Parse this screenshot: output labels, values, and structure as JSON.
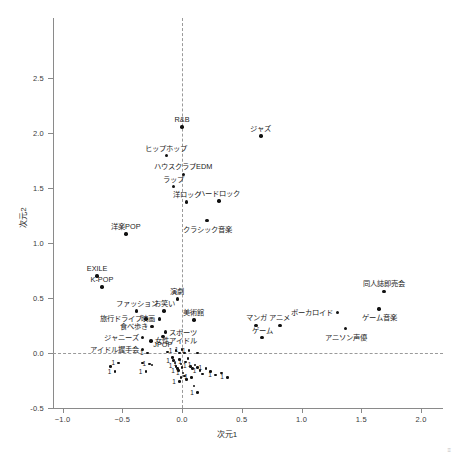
{
  "chart_data": {
    "type": "scatter",
    "title": "",
    "xlabel": "次元1",
    "ylabel": "次元2",
    "xlim": [
      -1.25,
      2.2
    ],
    "ylim": [
      -0.55,
      2.8
    ],
    "xticks": [
      -1.0,
      -0.5,
      0.0,
      0.5,
      1.0,
      1.5,
      2.0
    ],
    "xticklabels": [
      "−1.0",
      "−0.5",
      "0.0",
      "0.5",
      "1.0",
      "1.5",
      "2.0"
    ],
    "yticks": [
      -0.5,
      0.0,
      0.5,
      1.0,
      1.5,
      2.0,
      2.5
    ],
    "yticklabels": [
      "-0.5",
      "0.0",
      "0.5",
      "1.0",
      "1.5",
      "2.0",
      "2.5"
    ],
    "grid": false,
    "reference_lines": {
      "vertical_x": 0.0,
      "horizontal_y": 0.0,
      "style": "dashed"
    },
    "legend": null,
    "marker_color": "#111111",
    "labeled_points": [
      {
        "label": "R&B",
        "x": 0.0,
        "y": 2.05,
        "lpos": "above"
      },
      {
        "label": "ジャズ",
        "x": 0.66,
        "y": 1.97,
        "lpos": "above"
      },
      {
        "label": "ヒップホップ",
        "x": -0.13,
        "y": 1.79,
        "lpos": "above"
      },
      {
        "label": "ハウスクラブEDM",
        "x": 0.01,
        "y": 1.62,
        "lpos": "above"
      },
      {
        "label": "ラップ",
        "x": -0.07,
        "y": 1.51,
        "lpos": "above"
      },
      {
        "label": "洋ロック",
        "x": 0.04,
        "y": 1.37,
        "lpos": "above"
      },
      {
        "label": "ハードロック",
        "x": 0.31,
        "y": 1.38,
        "lpos": "above"
      },
      {
        "label": "洋楽POP",
        "x": -0.47,
        "y": 1.08,
        "lpos": "above"
      },
      {
        "label": "クラシック音楽",
        "x": 0.21,
        "y": 1.2,
        "lpos": "below"
      },
      {
        "label": "EXILE",
        "x": -0.71,
        "y": 0.7,
        "lpos": "above"
      },
      {
        "label": "K-POP",
        "x": -0.67,
        "y": 0.6,
        "lpos": "above"
      },
      {
        "label": "同人誌即売会",
        "x": 1.69,
        "y": 0.56,
        "lpos": "above"
      },
      {
        "label": "演劇",
        "x": -0.04,
        "y": 0.49,
        "lpos": "above"
      },
      {
        "label": "ファッション",
        "x": -0.38,
        "y": 0.38,
        "lpos": "above"
      },
      {
        "label": "お笑い",
        "x": -0.15,
        "y": 0.38,
        "lpos": "above"
      },
      {
        "label": "ボーカロイド",
        "x": 1.3,
        "y": 0.37,
        "lpos": "left"
      },
      {
        "label": "ゲーム音楽",
        "x": 1.65,
        "y": 0.4,
        "lpos": "below"
      },
      {
        "label": "旅行ドライブ",
        "x": -0.3,
        "y": 0.31,
        "lpos": "left"
      },
      {
        "label": "映画",
        "x": -0.19,
        "y": 0.31,
        "lpos": "left"
      },
      {
        "label": "美術館",
        "x": 0.1,
        "y": 0.3,
        "lpos": "above"
      },
      {
        "label": "マンガ",
        "x": 0.62,
        "y": 0.25,
        "lpos": "above"
      },
      {
        "label": "アニメ",
        "x": 0.82,
        "y": 0.25,
        "lpos": "above"
      },
      {
        "label": "食べ歩き",
        "x": -0.25,
        "y": 0.24,
        "lpos": "left"
      },
      {
        "label": "スポーツ",
        "x": -0.14,
        "y": 0.19,
        "lpos": "right"
      },
      {
        "label": "アニソン声優",
        "x": 1.37,
        "y": 0.22,
        "lpos": "below"
      },
      {
        "label": "JPOP",
        "x": -0.16,
        "y": 0.15,
        "lpos": "below"
      },
      {
        "label": "ゲーム",
        "x": 0.67,
        "y": 0.14,
        "lpos": "above"
      },
      {
        "label": "ジャニーズ",
        "x": -0.33,
        "y": 0.14,
        "lpos": "left"
      },
      {
        "label": "女性アイドル",
        "x": -0.26,
        "y": 0.11,
        "lpos": "right"
      },
      {
        "label": "アイドル握手会",
        "x": -0.33,
        "y": 0.03,
        "lpos": "left"
      }
    ],
    "unlabeled_points_note": "dense central cluster of unlabeled points, each annotated with the count label \"1\"",
    "count_label": "1",
    "cluster_points": [
      {
        "x": -0.29,
        "y": 0.0
      },
      {
        "x": -0.12,
        "y": 0.01
      },
      {
        "x": -0.05,
        "y": 0.02
      },
      {
        "x": -0.02,
        "y": 0.0
      },
      {
        "x": 0.0,
        "y": 0.03
      },
      {
        "x": 0.02,
        "y": 0.0
      },
      {
        "x": 0.06,
        "y": 0.02
      },
      {
        "x": 0.13,
        "y": 0.0
      },
      {
        "x": -0.53,
        "y": -0.09
      },
      {
        "x": -0.6,
        "y": -0.12
      },
      {
        "x": -0.56,
        "y": -0.17
      },
      {
        "x": -0.33,
        "y": -0.09
      },
      {
        "x": -0.27,
        "y": -0.1
      },
      {
        "x": -0.25,
        "y": -0.11
      },
      {
        "x": -0.3,
        "y": -0.17
      },
      {
        "x": -0.08,
        "y": -0.04
      },
      {
        "x": -0.07,
        "y": -0.07
      },
      {
        "x": -0.06,
        "y": -0.09
      },
      {
        "x": -0.05,
        "y": -0.12
      },
      {
        "x": -0.04,
        "y": -0.14
      },
      {
        "x": -0.03,
        "y": -0.16
      },
      {
        "x": -0.02,
        "y": -0.06
      },
      {
        "x": -0.01,
        "y": -0.1
      },
      {
        "x": 0.0,
        "y": -0.13
      },
      {
        "x": 0.01,
        "y": -0.18
      },
      {
        "x": 0.02,
        "y": -0.21
      },
      {
        "x": 0.03,
        "y": -0.08
      },
      {
        "x": 0.05,
        "y": -0.05
      },
      {
        "x": 0.07,
        "y": -0.12
      },
      {
        "x": 0.09,
        "y": -0.14
      },
      {
        "x": 0.11,
        "y": -0.11
      },
      {
        "x": 0.13,
        "y": -0.13
      },
      {
        "x": 0.15,
        "y": -0.16
      },
      {
        "x": 0.17,
        "y": -0.19
      },
      {
        "x": 0.2,
        "y": -0.14
      },
      {
        "x": 0.24,
        "y": -0.17
      },
      {
        "x": 0.28,
        "y": -0.2
      },
      {
        "x": 0.33,
        "y": -0.18
      },
      {
        "x": 0.38,
        "y": -0.22
      },
      {
        "x": 0.1,
        "y": -0.3
      },
      {
        "x": 0.13,
        "y": -0.36
      },
      {
        "x": -0.01,
        "y": -0.22
      },
      {
        "x": -0.02,
        "y": -0.26
      },
      {
        "x": 0.04,
        "y": -0.24
      },
      {
        "x": 0.08,
        "y": -0.22
      }
    ]
  },
  "corner_mark": "≡"
}
